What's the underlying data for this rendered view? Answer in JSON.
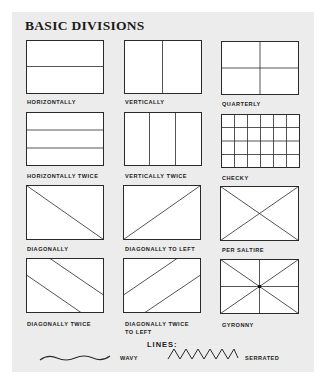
{
  "title": "BASIC DIVISIONS",
  "colors": {
    "background": "#ececec",
    "stroke": "#2a2a2a",
    "field": "#ffffff"
  },
  "divisions": [
    {
      "id": "horizontally",
      "label": "HORIZONTALLY"
    },
    {
      "id": "vertically",
      "label": "VERTICALLY"
    },
    {
      "id": "quarterly",
      "label": "QUARTERLY"
    },
    {
      "id": "horizontally-twice",
      "label": "HORIZONTALLY TWICE"
    },
    {
      "id": "vertically-twice",
      "label": "VERTICALLY TWICE"
    },
    {
      "id": "checky",
      "label": "CHECKY"
    },
    {
      "id": "diagonally",
      "label": "DIAGONALLY"
    },
    {
      "id": "diagonally-to-left",
      "label": "DIAGONALLY TO LEFT"
    },
    {
      "id": "per-saltire",
      "label": "PER SALTIRE"
    },
    {
      "id": "diagonally-twice",
      "label": "DIAGONALLY TWICE"
    },
    {
      "id": "diagonally-twice-to-left",
      "label_line1": "DIAGONALLY TWICE",
      "label_line2": "TO LEFT"
    },
    {
      "id": "gyronny",
      "label": "GYRONNY"
    }
  ],
  "lines": {
    "title": "LINES:",
    "items": [
      {
        "id": "wavy",
        "label": "WAVY"
      },
      {
        "id": "serrated",
        "label": "SERRATED"
      }
    ]
  }
}
